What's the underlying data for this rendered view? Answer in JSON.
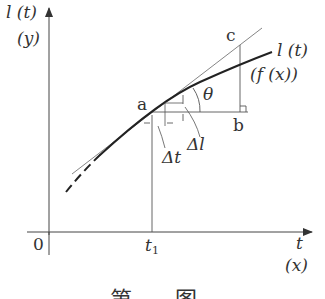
{
  "axes": {
    "y_label": "l (t)",
    "y_label_alt": "(y)",
    "x_label": "t",
    "x_label_alt": "(x)",
    "origin_label": "0",
    "t1_label": "t1",
    "t1_main": "t",
    "t1_sub": "1"
  },
  "curve": {
    "label": "l (t)",
    "label_alt": "(f (x))"
  },
  "points": {
    "a": "a",
    "b": "b",
    "c": "c"
  },
  "annotations": {
    "theta": "θ",
    "delta_l": "Δl",
    "delta_t": "Δt"
  },
  "caption": {
    "text": "第 图"
  },
  "colors": {
    "line": "#333333",
    "curve": "#222222",
    "background": "#ffffff"
  }
}
